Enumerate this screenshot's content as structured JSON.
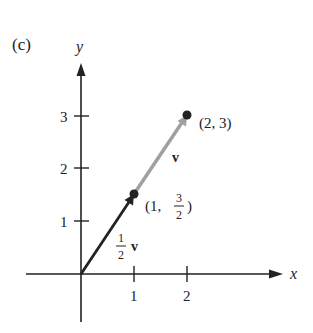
{
  "panel_label": "(c)",
  "axes": {
    "x_label": "x",
    "y_label": "y",
    "x_ticks": [
      "1",
      "2"
    ],
    "y_ticks": [
      "1",
      "2",
      "3"
    ]
  },
  "vectors": [
    {
      "name": "v",
      "label": "v",
      "from": [
        0,
        0
      ],
      "to": [
        2,
        3
      ],
      "color": "#a0a0a0"
    },
    {
      "name": "half_v",
      "label_num": "1",
      "label_den": "2",
      "label_vec": "v",
      "from": [
        0,
        0
      ],
      "to": [
        1,
        1.5
      ],
      "color": "#222222"
    }
  ],
  "points": [
    {
      "label": "(2, 3)",
      "x": 2,
      "y": 3
    },
    {
      "label_prefix": "(1,",
      "label_num": "3",
      "label_den": "2",
      "label_suffix": ")",
      "x": 1,
      "y": 1.5
    }
  ]
}
